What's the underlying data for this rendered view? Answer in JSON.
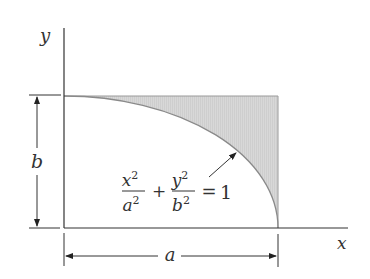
{
  "figure": {
    "axes": {
      "x_label": "x",
      "y_label": "y"
    },
    "dimensions": {
      "horizontal_label": "a",
      "vertical_label": "b"
    },
    "equation": {
      "term1_num": "x",
      "term1_num_exp": "2",
      "term1_den": "a",
      "term1_den_exp": "2",
      "plus": "+",
      "term2_num": "y",
      "term2_num_exp": "2",
      "term2_den": "b",
      "term2_den_exp": "2",
      "equals": "=",
      "rhs": "1"
    },
    "colors": {
      "line": "#333333",
      "shade": "#d6d6d6",
      "curve": "#8a8a8a"
    }
  }
}
